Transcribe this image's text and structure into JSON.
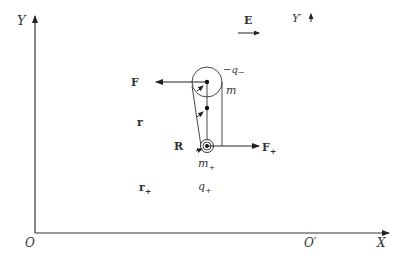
{
  "axes": {
    "x_label": "X",
    "y_label": "Y",
    "origin_label": "O",
    "origin_prime_label": "O′",
    "y_prime_label": "Y′"
  },
  "field": {
    "label": "E"
  },
  "forces": {
    "f_minus_label": "F",
    "f_plus_label": "F",
    "f_plus_sub": "+"
  },
  "vectors": {
    "r_label": "r",
    "r_plus_label": "r",
    "r_plus_sub": "+",
    "R_label": "R"
  },
  "charges": {
    "minus_charge_label": "−q",
    "minus_charge_sub": "−",
    "minus_mass_label": "m",
    "plus_mass_label": "m",
    "plus_mass_sub": "+",
    "plus_charge_label": "q",
    "plus_charge_sub": "+"
  },
  "colors": {
    "line": "#222222",
    "text": "#333333",
    "background": "#ffffff"
  }
}
